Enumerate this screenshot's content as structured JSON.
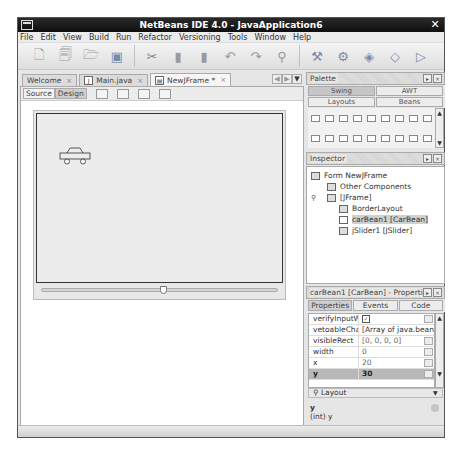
{
  "window": {
    "title": "NetBeans IDE 4.0 - JavaApplication6",
    "close_glyph": "✕"
  },
  "menubar": [
    "File",
    "Edit",
    "View",
    "Build",
    "Run",
    "Refactor",
    "Versioning",
    "Tools",
    "Window",
    "Help"
  ],
  "toolbar": {
    "groups": [
      [
        "new-file-icon",
        "new-project-icon",
        "open-project-icon",
        "save-all-icon"
      ],
      [
        "cut-icon",
        "copy-icon",
        "paste-icon",
        "undo-icon",
        "redo-icon",
        "find-icon"
      ],
      [
        "build-icon",
        "clean-build-icon",
        "run-icon",
        "debug-icon",
        "step-icon"
      ]
    ]
  },
  "editor": {
    "tabs": [
      {
        "label": "Welcome",
        "active": false
      },
      {
        "label": "Main.java",
        "active": false
      },
      {
        "label": "NewJFrame *",
        "active": true
      }
    ],
    "tab_close": "×",
    "view_toggle": {
      "source": "Source",
      "design": "Design"
    }
  },
  "palette": {
    "title": "Palette",
    "categories": [
      "Swing",
      "AWT",
      "Layouts",
      "Beans"
    ],
    "active_category": "Swing"
  },
  "inspector": {
    "title": "Inspector",
    "nodes": [
      {
        "label": "Form NewJFrame",
        "depth": 0
      },
      {
        "label": "Other Components",
        "depth": 1
      },
      {
        "label": "[JFrame]",
        "depth": 1
      },
      {
        "label": "BorderLayout",
        "depth": 2
      },
      {
        "label": "carBean1 [CarBean]",
        "depth": 2,
        "selected": true
      },
      {
        "label": "jSlider1 [JSlider]",
        "depth": 2
      }
    ]
  },
  "properties": {
    "title": "carBean1 [CarBean] - Properties",
    "tabs": [
      "Properties",
      "Events",
      "Code"
    ],
    "active_tab": "Properties",
    "rows": [
      {
        "name": "verifyInputWhen",
        "value": "✓"
      },
      {
        "name": "vetoableChange",
        "value": "[Array of java.bean"
      },
      {
        "name": "visibleRect",
        "value": "[0, 0, 0, 0]"
      },
      {
        "name": "width",
        "value": "0"
      },
      {
        "name": "x",
        "value": "20"
      },
      {
        "name": "y",
        "value": "30",
        "selected": true
      }
    ],
    "group": "Layout",
    "description": {
      "name": "y",
      "type": "(int) y"
    }
  }
}
